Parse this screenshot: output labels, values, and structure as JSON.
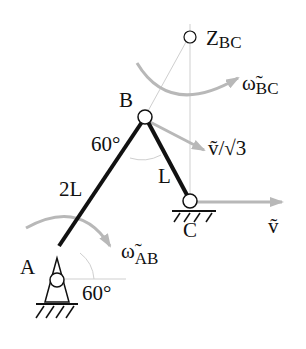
{
  "diagram": {
    "type": "mechanism-kinematics",
    "points": {
      "A": {
        "label": "A"
      },
      "B": {
        "label": "B"
      },
      "C": {
        "label": "C"
      },
      "Z_BC": {
        "label": "Z",
        "sub": "BC"
      }
    },
    "links": {
      "AB": {
        "length_label": "2L"
      },
      "BC": {
        "length_label": "L"
      }
    },
    "angles": {
      "at_A": "60°",
      "at_B": "60°"
    },
    "vectors": {
      "omega_AB": {
        "sym": "ω̃",
        "sub": "AB"
      },
      "omega_BC": {
        "sym": "ω̃",
        "sub": "BC"
      },
      "v_B": {
        "text": "ṽ/",
        "root": "√3"
      },
      "v_C": {
        "text": "ṽ"
      }
    },
    "colors": {
      "link": "#111111",
      "arrow": "#b8b8b8",
      "construction": "#c8c8c8"
    }
  }
}
